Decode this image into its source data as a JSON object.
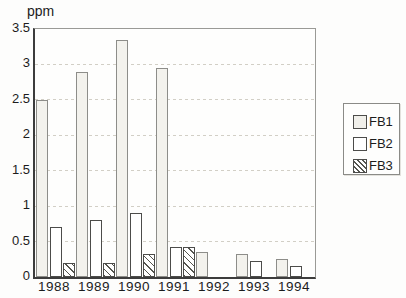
{
  "chart_data": {
    "type": "bar",
    "title": "",
    "ylabel": "ppm",
    "xlabel": "",
    "categories": [
      "1988",
      "1989",
      "1990",
      "1991",
      "1992",
      "1993",
      "1994"
    ],
    "series": [
      {
        "name": "FB1",
        "style": "light",
        "values": [
          2.5,
          2.9,
          3.35,
          2.95,
          0.35,
          0.33,
          0.26
        ]
      },
      {
        "name": "FB2",
        "style": "white",
        "values": [
          0.7,
          0.8,
          0.9,
          0.43,
          0,
          0.22,
          0.15
        ]
      },
      {
        "name": "FB3",
        "style": "hatch",
        "values": [
          0.2,
          0.2,
          0.33,
          0.43,
          0,
          0,
          0
        ]
      }
    ],
    "ylim": [
      0,
      3.5
    ],
    "yticks": [
      0,
      0.5,
      1,
      1.5,
      2,
      2.5,
      3,
      3.5
    ],
    "grid": "horizontal-dashed",
    "legend_position": "right-outside"
  },
  "legend": {
    "items": [
      {
        "label": "FB1",
        "style": "light"
      },
      {
        "label": "FB2",
        "style": "white"
      },
      {
        "label": "FB3",
        "style": "hatch"
      }
    ]
  },
  "colors": {
    "fb1_fill": "#f3f2ed",
    "fb2_fill": "#ffffff",
    "hatch_line": "#55554f",
    "gridline": "#d2cfc6",
    "axis": "#3c3c3c",
    "text": "#1c1c1c",
    "background": "#fdfdfc"
  }
}
